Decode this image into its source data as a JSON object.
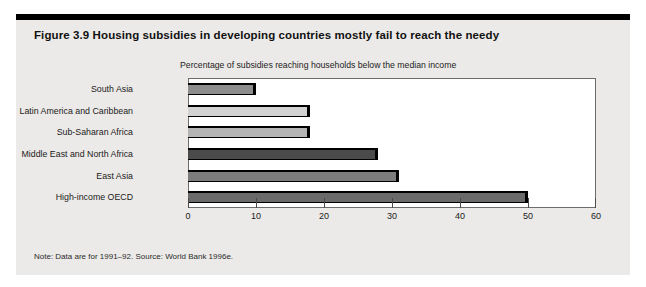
{
  "figure": {
    "title": "Figure 3.9  Housing subsidies in developing countries mostly fail to reach the needy",
    "note": "Note: Data are for 1991–92. Source: World Bank 1996e.",
    "background_color": "#eceae8",
    "rule_color": "#000000"
  },
  "chart_data": {
    "type": "bar",
    "orientation": "horizontal",
    "title": "Figure 3.9  Housing subsidies in developing countries mostly fail to reach the needy",
    "subtitle": "Percentage of subsidies reaching households below the median income",
    "xlabel": "",
    "ylabel": "",
    "xlim": [
      0,
      60
    ],
    "xticks": [
      0,
      10,
      20,
      30,
      40,
      50,
      60
    ],
    "xtick_labels": [
      "0",
      "10",
      "20",
      "30",
      "40",
      "50",
      "60"
    ],
    "grid": false,
    "legend": "none",
    "categories": [
      "South Asia",
      "Latin America and Caribbean",
      "Sub-Saharan Africa",
      "Middle East and North Africa",
      "East Asia",
      "High-income OECD"
    ],
    "values": [
      10,
      18,
      18,
      28,
      31,
      50
    ],
    "bar_colors": [
      "#8d8d8d",
      "#d2d2d2",
      "#b4b4b4",
      "#4a4a4a",
      "#7c7c7c",
      "#6a6a6a"
    ],
    "bar_edge_color": "#000000",
    "plot_background": "#ffffff",
    "plot_border_color": "#6d6d6d",
    "note": "Note: Data are for 1991–92. Source: World Bank 1996e."
  }
}
